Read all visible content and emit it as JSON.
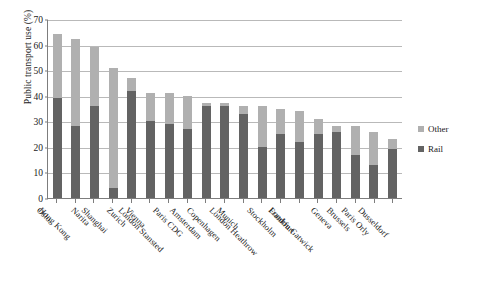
{
  "chart_data": {
    "type": "bar",
    "stacked": true,
    "title": "",
    "xlabel": "",
    "ylabel": "Public transport use (%)",
    "ylim": [
      0,
      70
    ],
    "ytick_values": [
      0,
      10,
      20,
      30,
      40,
      50,
      60,
      70
    ],
    "grid": "horizontal",
    "legend_position": "right",
    "categories": [
      "Oslo",
      "Hong Kong",
      "Narita",
      "Shanghai",
      "Zurich",
      "Vienna",
      "London Stansted",
      "Paris CDG",
      "Amsterdam",
      "Copenhagen",
      "Munich",
      "London Heathrow",
      "Stockholm",
      "Frankfurt",
      "London Gatwick",
      "Geneva",
      "Brussels",
      "Paris Orly",
      "Dusseldorf"
    ],
    "series": [
      {
        "name": "Rail",
        "color": "#636363",
        "values": [
          39,
          28,
          36,
          4,
          42,
          30,
          29,
          27,
          36,
          36,
          33,
          20,
          25,
          22,
          25,
          26,
          17,
          13,
          19
        ]
      },
      {
        "name": "Other",
        "color": "#b0b0b0",
        "values": [
          25,
          34,
          23,
          47,
          5,
          11,
          12,
          13,
          1,
          1,
          3,
          16,
          10,
          12,
          6,
          2,
          11,
          13,
          4
        ]
      }
    ],
    "totals": [
      64,
      62,
      59,
      51,
      47,
      41,
      41,
      40,
      37,
      37,
      36,
      36,
      35,
      34,
      31,
      28,
      28,
      26,
      23
    ]
  },
  "legend": {
    "items": [
      {
        "label": "Other",
        "color": "#b0b0b0"
      },
      {
        "label": "Rail",
        "color": "#636363"
      }
    ]
  }
}
